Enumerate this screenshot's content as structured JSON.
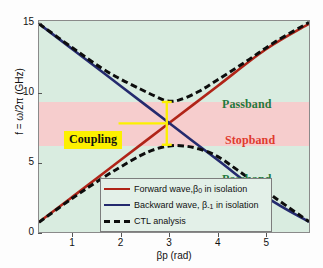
{
  "chart_data": {
    "type": "line",
    "title": "",
    "xlabel": "βp (rad)",
    "ylabel": "f = ω/2π (GHz)",
    "xlim": [
      0.3,
      5.9
    ],
    "ylim": [
      0,
      15.2
    ],
    "xticks": [
      1,
      2,
      3,
      4,
      5
    ],
    "yticks": [
      0,
      5,
      10,
      15
    ],
    "grid": false,
    "legend_position": "lower center",
    "series": [
      {
        "name": "Forward wave,β₀ in isolation",
        "color": "#b02418",
        "style": "solid",
        "x": [
          0.3,
          1.0,
          2.0,
          3.0,
          4.0,
          5.0,
          5.9
        ],
        "y": [
          0.72,
          2.55,
          5.2,
          7.85,
          10.5,
          13.15,
          15.0
        ]
      },
      {
        "name": "Backward wave, β₋₁ in isolation",
        "color": "#242a6e",
        "style": "solid",
        "x": [
          0.3,
          1.0,
          2.0,
          3.0,
          4.0,
          5.0,
          5.9
        ],
        "y": [
          15.0,
          13.15,
          10.5,
          7.85,
          5.2,
          2.55,
          0.72
        ]
      },
      {
        "name": "CTL analysis",
        "color": "#0d0d0d",
        "style": "dashed",
        "branches": [
          {
            "label": "upper-branch",
            "x": [
              0.3,
              1.0,
              1.6,
              2.0,
              2.4,
              2.7,
              2.95,
              3.2,
              3.6,
              4.0,
              4.6,
              5.2,
              5.9
            ],
            "y": [
              15.0,
              13.25,
              11.8,
              11.0,
              10.3,
              9.8,
              9.45,
              9.5,
              10.1,
              10.95,
              12.3,
              13.7,
              15.1
            ]
          },
          {
            "label": "lower-branch",
            "x": [
              0.3,
              1.0,
              1.6,
              2.0,
              2.4,
              2.7,
              3.0,
              3.3,
              3.6,
              4.0,
              4.6,
              5.2,
              5.9
            ],
            "y": [
              0.7,
              2.45,
              3.85,
              4.7,
              5.5,
              5.95,
              6.2,
              6.2,
              6.0,
              5.45,
              4.0,
              2.45,
              0.75
            ]
          }
        ]
      }
    ],
    "regions": [
      {
        "name": "passband-upper",
        "type": "passband",
        "ymin": 9.4,
        "ymax": 15.2,
        "color": "#d9ece0",
        "label": "Passband",
        "label_color": "#1f7a3d"
      },
      {
        "name": "stopband",
        "type": "stopband",
        "ymin": 6.25,
        "ymax": 9.4,
        "color": "#f6cdcd",
        "label": "Stopband",
        "label_color": "#e03a2f"
      },
      {
        "name": "passband-lower",
        "type": "passband",
        "ymin": 0.0,
        "ymax": 6.25,
        "color": "#d9ece0",
        "label": "Passband",
        "label_color": "#1f7a3d"
      }
    ],
    "annotations": [
      {
        "name": "coupling",
        "text": "Coupling",
        "box_color": "#fcf000",
        "text_color": "#111111",
        "x": 1.45,
        "y": 7.85
      },
      {
        "name": "coupling-gap-arrow",
        "type": "double-arrow",
        "color": "#fcf000",
        "x": 2.95,
        "y_from": 6.2,
        "y_to": 9.45
      }
    ]
  },
  "axes": {
    "y": {
      "label": "f = ω/2π (GHz)",
      "ticks": [
        {
          "value": 15,
          "label": "15"
        },
        {
          "value": 10,
          "label": "10"
        },
        {
          "value": 5,
          "label": "5"
        },
        {
          "value": 0,
          "label": "0"
        }
      ]
    },
    "x": {
      "label_main": "βp (rad)",
      "ticks": [
        {
          "value": 1,
          "label": "1"
        },
        {
          "value": 2,
          "label": "2"
        },
        {
          "value": 3,
          "label": "3"
        },
        {
          "value": 4,
          "label": "4"
        },
        {
          "value": 5,
          "label": "5"
        }
      ]
    }
  },
  "legend": {
    "entries": [
      {
        "name": "forward-wave",
        "prefix": "Forward wave,β",
        "sub": "0",
        "suffix": " in isolation",
        "color": "#b02418",
        "style": "solid"
      },
      {
        "name": "backward-wave",
        "prefix": "Backward wave, β",
        "sub": "-1",
        "suffix": " in isolation",
        "color": "#242a6e",
        "style": "solid"
      },
      {
        "name": "ctl-analysis",
        "prefix": "CTL analysis",
        "sub": "",
        "suffix": "",
        "color": "#0d0d0d",
        "style": "dashed"
      }
    ]
  },
  "labels": {
    "passband_top": "Passband",
    "stopband": "Stopband",
    "passband_bottom": "Passband",
    "coupling": "Coupling"
  }
}
